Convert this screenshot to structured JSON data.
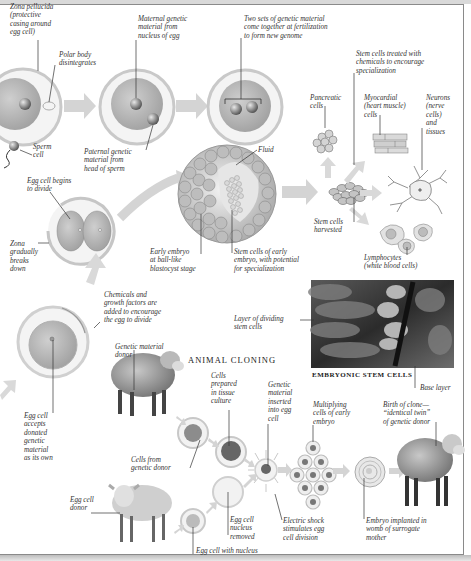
{
  "colors": {
    "zona": "#d8d8d8",
    "cell_fill": "#b3b3b3",
    "nucleus": "#6f6f6f",
    "arrow": "#cfcfcf",
    "line": "#333333",
    "frame": "#8a8a8a"
  },
  "fertilization": {
    "zona_pellucida": "Zona pellucida\n(protective\ncasing around\negg cell)",
    "polar_body": "Polar body\ndisintegrates",
    "sperm_cell": "Sperm\ncell",
    "maternal": "Maternal genetic\nmaterial from\nnucleus of egg",
    "paternal": "Paternal genetic\nmaterial from\nhead of sperm",
    "two_sets": "Two sets of  genetic material\ncome together at fertilization\nto form new genome"
  },
  "embryo": {
    "egg_divide": "Egg cell begins\nto divide",
    "zona_breaks": "Zona\ngradually\nbreaks\ndown",
    "fluid": "Fluid",
    "early_embryo": "Early embryo\nat ball-like\nblastocyst stage",
    "stem_cells_early": "Stem cells of  early\nembryo, with potential\nfor specialization"
  },
  "stem_cells": {
    "treated": "Stem cells treated with\nchemicals to encourage\nspecialization",
    "pancreatic": "Pancreatic\ncells",
    "myocardial": "Myocardial\n(heart muscle)\ncells",
    "neurons": "Neurons\n(nerve\ncells)\nand\ntissues",
    "harvested": "Stem cells\nharvested",
    "lymphocytes": "Lymphocytes\n(white blood cells)"
  },
  "micrograph": {
    "layer": "Layer of  dividing\nstem cells",
    "caption": "EMBRYONIC STEM CELLS",
    "base": "Base layer"
  },
  "cloning": {
    "title": "ANIMAL CLONING",
    "chemicals": "Chemicals and\ngrowth factors are\nadded to encourage\nthe egg to divide",
    "accepts": "Egg cell\naccepts\ndonated\ngenetic\nmaterial\nas its own",
    "donor": "Genetic material\ndonor",
    "cells_prepared": "Cells\nprepared\nin tissue\nculture",
    "genetic_inserted": "Genetic\nmaterial\ninserted\ninto egg\ncell",
    "multiplying": "Multiplying\ncells of early\nembryo",
    "birth": "Birth of  clone—\n“identical twin”\nof  genetic donor",
    "cells_from": "Cells from\ngenetic donor",
    "egg_donor": "Egg cell\ndonor",
    "nucleus_removed": "Egg cell\nnucleus\nremoved",
    "electric": "Electric shock\nstimulates egg\ncell division",
    "implanted": "Embryo implanted in\nwomb of  surrogate\nmother",
    "with_nucleus": "Egg cell with nucleus"
  }
}
